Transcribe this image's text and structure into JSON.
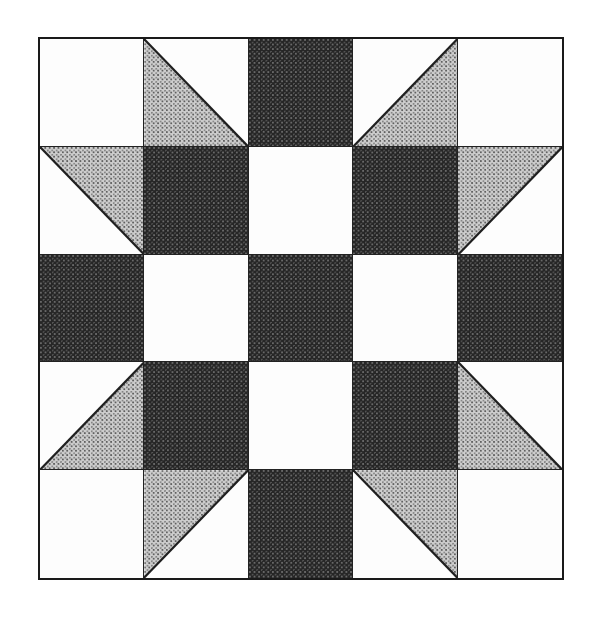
{
  "image": {
    "kind": "quilt-block-diagram",
    "title": "Quilt block pattern diagram",
    "background_color": "#ffffff",
    "canvas": {
      "width": 598,
      "height": 625
    }
  },
  "block": {
    "name": "star-quilt-block",
    "grid_rows": 5,
    "grid_cols": 5,
    "outline_color": "#1a1a1a",
    "outline_width": 2,
    "seam_color": "#222222",
    "origin": {
      "x": 38,
      "y": 37
    },
    "size": {
      "width": 526,
      "height": 543
    },
    "cell_size": {
      "width": 105,
      "height": 108
    }
  },
  "fabrics": {
    "white": {
      "label": "white",
      "color": "#fdfdfd",
      "texture": "plain"
    },
    "grey": {
      "label": "grey",
      "color": "#cdcdcd",
      "texture": "light-halftone-dots"
    },
    "dark": {
      "label": "dark",
      "color": "#262626",
      "texture": "dense-dark-halftone-dots"
    }
  },
  "patches": [
    {
      "row": 1,
      "col": 1,
      "shape": "square",
      "fabric": "white"
    },
    {
      "row": 1,
      "col": 2,
      "shape": "half-square-triangle",
      "fabric": "grey",
      "triangle": "bottom-left",
      "background": "white"
    },
    {
      "row": 1,
      "col": 3,
      "shape": "square",
      "fabric": "dark"
    },
    {
      "row": 1,
      "col": 4,
      "shape": "half-square-triangle",
      "fabric": "grey",
      "triangle": "bottom-right",
      "background": "white"
    },
    {
      "row": 1,
      "col": 5,
      "shape": "square",
      "fabric": "white"
    },
    {
      "row": 2,
      "col": 1,
      "shape": "half-square-triangle",
      "fabric": "grey",
      "triangle": "top-right",
      "background": "white"
    },
    {
      "row": 2,
      "col": 2,
      "shape": "square",
      "fabric": "dark"
    },
    {
      "row": 2,
      "col": 3,
      "shape": "square",
      "fabric": "white"
    },
    {
      "row": 2,
      "col": 4,
      "shape": "square",
      "fabric": "dark"
    },
    {
      "row": 2,
      "col": 5,
      "shape": "half-square-triangle",
      "fabric": "grey",
      "triangle": "top-left",
      "background": "white"
    },
    {
      "row": 3,
      "col": 1,
      "shape": "square",
      "fabric": "dark"
    },
    {
      "row": 3,
      "col": 2,
      "shape": "square",
      "fabric": "white"
    },
    {
      "row": 3,
      "col": 3,
      "shape": "square",
      "fabric": "dark"
    },
    {
      "row": 3,
      "col": 4,
      "shape": "square",
      "fabric": "white"
    },
    {
      "row": 3,
      "col": 5,
      "shape": "square",
      "fabric": "dark"
    },
    {
      "row": 4,
      "col": 1,
      "shape": "half-square-triangle",
      "fabric": "grey",
      "triangle": "bottom-right",
      "background": "white"
    },
    {
      "row": 4,
      "col": 2,
      "shape": "square",
      "fabric": "dark"
    },
    {
      "row": 4,
      "col": 3,
      "shape": "square",
      "fabric": "white"
    },
    {
      "row": 4,
      "col": 4,
      "shape": "square",
      "fabric": "dark"
    },
    {
      "row": 4,
      "col": 5,
      "shape": "half-square-triangle",
      "fabric": "grey",
      "triangle": "bottom-left",
      "background": "white"
    },
    {
      "row": 5,
      "col": 1,
      "shape": "square",
      "fabric": "white"
    },
    {
      "row": 5,
      "col": 2,
      "shape": "half-square-triangle",
      "fabric": "grey",
      "triangle": "top-left",
      "background": "white"
    },
    {
      "row": 5,
      "col": 3,
      "shape": "square",
      "fabric": "dark"
    },
    {
      "row": 5,
      "col": 4,
      "shape": "half-square-triangle",
      "fabric": "grey",
      "triangle": "top-right",
      "background": "white"
    },
    {
      "row": 5,
      "col": 5,
      "shape": "square",
      "fabric": "white"
    }
  ]
}
